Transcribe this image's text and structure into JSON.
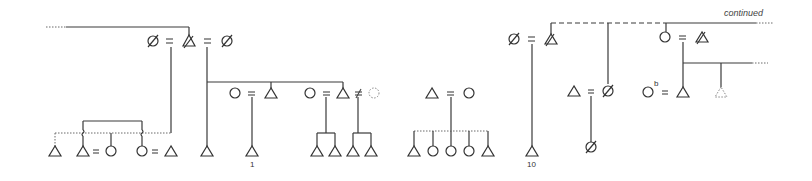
{
  "diagram": {
    "type": "kinship-chart",
    "background": "#ffffff",
    "line_color": "#3a3a3a",
    "labels": {
      "continued": "continued",
      "num_1": "1",
      "num_10": "10",
      "superscript_b": "b"
    },
    "legend_symbols": {
      "triangle": "male",
      "circle": "female",
      "slashed": "deceased",
      "dotted": "uncertain / hypothetical",
      "equals": "marriage",
      "not_equals": "non-marital union"
    },
    "groups": [
      {
        "id": "g1",
        "couple": [
          "deceased-female",
          "deceased-male",
          "deceased-female"
        ],
        "children_count": 5
      },
      {
        "id": "g2",
        "couple": [
          "female",
          "male"
        ],
        "child_label": "1"
      },
      {
        "id": "g3",
        "couple": [
          "female",
          "male",
          "dotted-female"
        ],
        "children_count": 4
      },
      {
        "id": "g4",
        "couple": [
          "male",
          "female"
        ],
        "children": [
          "male",
          "female",
          "female",
          "female",
          "male"
        ]
      },
      {
        "id": "g5",
        "couple": [
          "deceased-female",
          "deceased-male"
        ],
        "child_label": "10"
      },
      {
        "id": "g6",
        "couple": [
          "male",
          "deceased-female"
        ],
        "children": [
          "deceased-female"
        ]
      },
      {
        "id": "g7",
        "couple": [
          "female",
          "deceased-male"
        ],
        "children": [
          "male",
          "dotted-male"
        ]
      },
      {
        "id": "g8",
        "couple": [
          "female-b",
          "male"
        ]
      }
    ]
  }
}
